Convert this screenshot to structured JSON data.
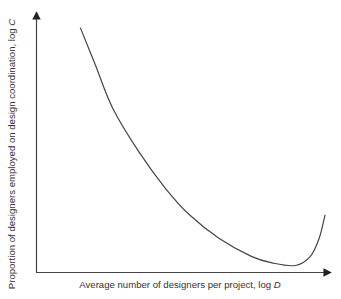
{
  "chart_data": {
    "type": "line",
    "title": "",
    "xlabel": "Average number of designers per project, log D",
    "ylabel": "Proportion of designers employed on design coordination, log C",
    "xlabel_parts": {
      "text": "Average number of designers per project, log ",
      "var": "D"
    },
    "ylabel_parts": {
      "text": "Proportion of designers employed on design coordination, log ",
      "var": "C"
    },
    "grid": false,
    "legend": null,
    "ticks": false,
    "series": [
      {
        "name": "curve",
        "color": "#444444",
        "x": [
          0.15,
          0.2,
          0.26,
          0.35,
          0.44,
          0.52,
          0.62,
          0.73,
          0.8,
          0.88,
          0.93,
          0.96,
          0.98
        ],
        "y": [
          0.94,
          0.8,
          0.63,
          0.46,
          0.32,
          0.22,
          0.13,
          0.06,
          0.035,
          0.025,
          0.06,
          0.13,
          0.22
        ]
      }
    ],
    "xlim": [
      0,
      1
    ],
    "ylim": [
      0,
      1
    ]
  },
  "axes": {
    "color": "#333333"
  }
}
